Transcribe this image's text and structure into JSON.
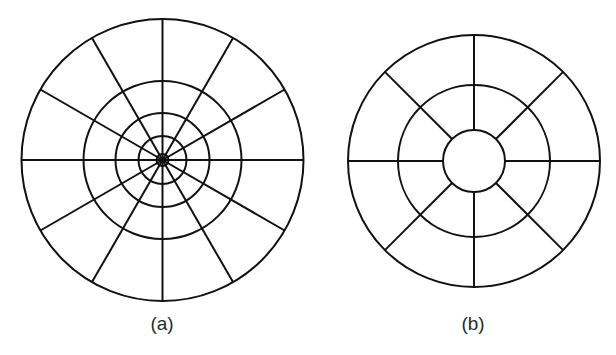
{
  "figure": {
    "stroke_color": "#111111",
    "stroke_width": 2,
    "panels": [
      {
        "id": "a",
        "caption": "(a)",
        "caption_pos": {
          "x": 162,
          "y": 313
        },
        "center": {
          "x": 162.5,
          "y": 160
        },
        "outer_radius": 141,
        "inner_circle_radii": [
          79,
          47,
          24,
          6
        ],
        "spoke_count": 12,
        "spoke_start_angle_deg": 0,
        "spoke_inner_radius": 0
      },
      {
        "id": "b",
        "caption": "(b)",
        "caption_pos": {
          "x": 473,
          "y": 313
        },
        "center": {
          "x": 474,
          "y": 161
        },
        "outer_radius": 126,
        "inner_circle_radii": [
          76,
          31
        ],
        "spoke_count": 8,
        "spoke_start_angle_deg": 0,
        "spoke_inner_radius": 31
      }
    ]
  }
}
